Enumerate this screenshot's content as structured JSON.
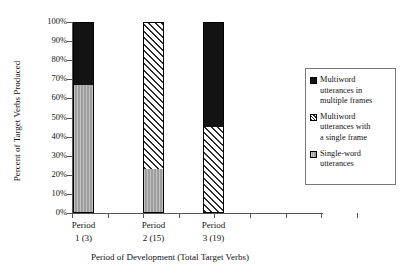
{
  "chart_data": {
    "type": "bar",
    "subtype": "stacked-bar-percent",
    "title": "",
    "xlabel": "Period of Development (Total Target Verbs)",
    "ylabel": "Percent of Target Verbs Produced",
    "categories": [
      "Period 1 (3)",
      "Period 2 (15)",
      "Period 3 (19)"
    ],
    "category_lines": [
      [
        "Period",
        "1 (3)"
      ],
      [
        "Period",
        "2 (15)"
      ],
      [
        "Period",
        "3 (19)"
      ]
    ],
    "ylim": [
      0,
      100
    ],
    "ytick_step": 10,
    "ytick_labels": [
      "100%",
      "90%",
      "80%",
      "70%",
      "60%",
      "50%",
      "40%",
      "30%",
      "20%",
      "10%",
      "0%"
    ],
    "ytick_values": [
      100,
      90,
      80,
      70,
      60,
      50,
      40,
      30,
      20,
      10,
      0
    ],
    "grid": false,
    "legend_position": "right",
    "series": [
      {
        "name": "Multiword utterances in multiple frames",
        "name_lines": [
          "Multiword",
          "utterances in",
          "multiple frames"
        ],
        "fill": "solid-black",
        "color": "#131313",
        "values": [
          33,
          0,
          55
        ]
      },
      {
        "name": "Multiword utterances with a single frame",
        "name_lines": [
          "Multiword",
          "utterances with",
          "a single frame"
        ],
        "fill": "diagonal-hatch",
        "color": "#2b2b2b",
        "values": [
          0,
          77,
          45
        ]
      },
      {
        "name": "Single-word utterances",
        "name_lines": [
          "Single-word",
          "utterances"
        ],
        "fill": "solid-gray",
        "color": "#9d9d9d",
        "values": [
          67,
          23,
          0
        ]
      }
    ]
  }
}
